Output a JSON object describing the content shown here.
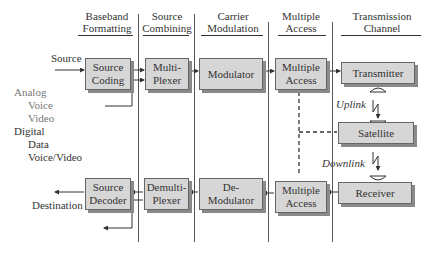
{
  "headers": [
    {
      "id": "baseband",
      "line1": "Baseband",
      "line2": "Formatting"
    },
    {
      "id": "source-combining",
      "line1": "Source",
      "line2": "Combining"
    },
    {
      "id": "carrier-modulation",
      "line1": "Carrier",
      "line2": "Modulation"
    },
    {
      "id": "multiple-access",
      "line1": "Multiple",
      "line2": "Access"
    },
    {
      "id": "transmission-channel",
      "line1": "Transmission",
      "line2": "Channel"
    }
  ],
  "tx_chain": [
    {
      "line1": "Source",
      "line2": "Coding"
    },
    {
      "line1": "Multi-",
      "line2": "Plexer"
    },
    {
      "line1": "Modulator",
      "line2": ""
    },
    {
      "line1": "Multiple",
      "line2": "Access"
    },
    {
      "line1": "Transmitter",
      "line2": ""
    }
  ],
  "rx_chain": [
    {
      "line1": "Source",
      "line2": "Decoder"
    },
    {
      "line1": "Demulti-",
      "line2": "Plexer"
    },
    {
      "line1": "De-",
      "line2": "Modulator"
    },
    {
      "line1": "Multiple",
      "line2": "Access"
    },
    {
      "line1": "Receiver",
      "line2": ""
    }
  ],
  "satellite": {
    "label": "Satellite"
  },
  "links": {
    "uplink": "Uplink",
    "downlink": "Downlink"
  },
  "labels": {
    "source": "Source",
    "destination": "Destination",
    "analog": "Analog",
    "voice": "Voice",
    "video": "Video",
    "digital": "Digital",
    "data": "Data",
    "voice_video": "Voice/Video"
  },
  "colors": {
    "box_fill": "#d6d6d6",
    "box_shadow": "#8a8a8a",
    "line": "#333333"
  }
}
